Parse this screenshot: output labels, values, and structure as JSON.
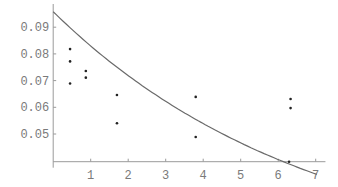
{
  "chart_data": {
    "type": "scatter",
    "title": "",
    "xlabel": "",
    "ylabel": "",
    "xlim": [
      0,
      7.1
    ],
    "ylim": [
      0.0396,
      0.0985
    ],
    "x_axis_crossing_y": 0.0396,
    "grid": false,
    "legend": null,
    "x_ticks": [
      1,
      2,
      3,
      4,
      5,
      6,
      7
    ],
    "x_tick_labels": [
      "1",
      "2",
      "3",
      "4",
      "5",
      "6",
      "7"
    ],
    "y_ticks": [
      0.05,
      0.06,
      0.07,
      0.08,
      0.09
    ],
    "y_tick_labels": [
      "0.05",
      "0.06",
      "0.07",
      "0.08",
      "0.09"
    ],
    "series": [
      {
        "name": "data points",
        "kind": "scatter",
        "points": [
          {
            "x": 0.45,
            "y": 0.0818
          },
          {
            "x": 0.45,
            "y": 0.0772
          },
          {
            "x": 0.45,
            "y": 0.0689
          },
          {
            "x": 0.87,
            "y": 0.0736
          },
          {
            "x": 0.87,
            "y": 0.0711
          },
          {
            "x": 1.7,
            "y": 0.0646
          },
          {
            "x": 1.7,
            "y": 0.054
          },
          {
            "x": 3.8,
            "y": 0.0639
          },
          {
            "x": 3.8,
            "y": 0.0489
          },
          {
            "x": 6.33,
            "y": 0.0631
          },
          {
            "x": 6.33,
            "y": 0.0597
          },
          {
            "x": 6.29,
            "y": 0.0396
          }
        ]
      },
      {
        "name": "fitted curve",
        "kind": "line",
        "model": "y = a * exp(-k * x)",
        "a": 0.0958,
        "k": 0.1438,
        "x_range": [
          0,
          7.03
        ]
      }
    ]
  },
  "layout": {
    "origin_px": [
      53.2,
      161.7
    ],
    "px_per_x": 37.5,
    "y_ref_value": 0.05,
    "y_ref_px": 134,
    "px_per_y": 2670
  },
  "colors": {
    "axis": "#9a9a9a",
    "curve": "#6a6a6a",
    "points": "#222222",
    "labels": "#7a7a7a"
  }
}
